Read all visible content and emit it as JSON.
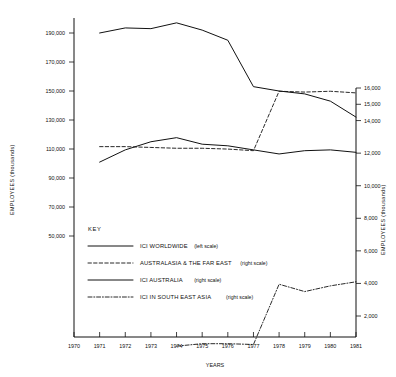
{
  "chart_data": {
    "type": "line",
    "title": "",
    "xlabel": "YEARS",
    "ylabel": "EMPLOYEES (thousands)",
    "ylabel_right": "EMPLOYEES (thousands)",
    "x": [
      1970,
      1971,
      1972,
      1973,
      1974,
      1975,
      1976,
      1977,
      1978,
      1979,
      1980,
      1981
    ],
    "xlim": [
      1970,
      1981
    ],
    "xticks": [
      "1970",
      "1971",
      "1972",
      "1973",
      "1974",
      "1975",
      "1976",
      "1977",
      "1978",
      "1979",
      "1980",
      "1981"
    ],
    "grid": false,
    "legend_position": "inside-lower-left",
    "left_axis": {
      "label": "EMPLOYEES (thousands)",
      "ylim": [
        50000,
        200000
      ],
      "ticks": [
        190000,
        170000,
        150000,
        130000,
        110000,
        90000,
        70000,
        50000
      ],
      "tick_labels": [
        "190,000",
        "170,000",
        "150,000",
        "130,000",
        "110,000",
        "90,000",
        "70,000",
        "50,000"
      ]
    },
    "right_axis": {
      "label": "EMPLOYEES (thousands)",
      "ylim": [
        0,
        16600
      ],
      "ticks": [
        16000,
        15000,
        14000,
        12000,
        10000,
        8000,
        6000,
        4000,
        2000
      ],
      "tick_labels": [
        "16,000",
        "15,000",
        "14,000",
        "12,000",
        "10,000",
        "8,000",
        "6,000",
        "4,000",
        "2,000"
      ]
    },
    "series": [
      {
        "name": "ICI WORLDWIDE",
        "scale": "left scale",
        "axis": "left",
        "style": "solid",
        "x": [
          1971,
          1972,
          1973,
          1974,
          1975,
          1976,
          1977,
          1978,
          1979,
          1980,
          1981
        ],
        "values": [
          190000,
          193500,
          193000,
          197000,
          192000,
          185000,
          153000,
          150000,
          148000,
          143000,
          132000
        ]
      },
      {
        "name": "AUSTRALASIA & THE FAR EAST",
        "scale": "right scale",
        "axis": "right",
        "style": "dashed",
        "x": [
          1971,
          1972,
          1973,
          1974,
          1975,
          1976,
          1977,
          1978,
          1979,
          1980,
          1981
        ],
        "values": [
          12400,
          12400,
          12350,
          12300,
          12300,
          12250,
          12150,
          15800,
          15750,
          15800,
          15700
        ]
      },
      {
        "name": "ICI AUSTRALIA",
        "scale": "right scale",
        "axis": "right",
        "style": "solid",
        "x": [
          1971,
          1972,
          1973,
          1974,
          1975,
          1976,
          1977,
          1978,
          1979,
          1980,
          1981
        ],
        "values": [
          11450,
          12200,
          12700,
          12950,
          12550,
          12450,
          12200,
          11950,
          12150,
          12200,
          12050
        ]
      },
      {
        "name": "ICI IN SOUTH EAST ASIA",
        "scale": "right scale",
        "axis": "right",
        "style": "dashdot",
        "x": [
          1974,
          1975,
          1976,
          1977,
          1978,
          1979,
          1980,
          1981
        ],
        "values": [
          150,
          300,
          300,
          250,
          3950,
          3500,
          3850,
          4100
        ]
      }
    ]
  },
  "axes": {
    "left_title": "EMPLOYEES (thousands)",
    "right_title": "EMPLOYEES (thousands)",
    "x_title": "YEARS"
  },
  "key": {
    "title": "KEY",
    "items": [
      {
        "label": "ICI WORLDWIDE",
        "scale": "(left scale)",
        "style": "solid"
      },
      {
        "label": "AUSTRALASIA & THE FAR EAST",
        "scale": "(right scale)",
        "style": "dashed"
      },
      {
        "label": "ICI AUSTRALIA",
        "scale": "(right scale)",
        "style": "solid"
      },
      {
        "label": "ICI IN SOUTH EAST ASIA",
        "scale": "(right scale)",
        "style": "dashdot"
      }
    ]
  }
}
